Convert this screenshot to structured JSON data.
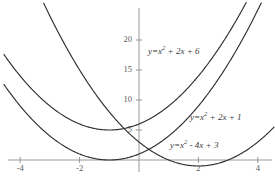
{
  "chart_data": {
    "type": "line",
    "title": "",
    "xlabel": "",
    "ylabel": "",
    "xlim": [
      -4.0,
      4.3
    ],
    "ylim": [
      -1.5,
      23.5
    ],
    "grid": false,
    "legend_position": "inline-annotations",
    "x_ticks": [
      -4,
      -2,
      2,
      4
    ],
    "x_tick_labels": [
      "-4",
      "-2",
      "2",
      "4"
    ],
    "y_ticks": [
      5,
      10,
      15,
      20
    ],
    "y_tick_labels": [
      "5",
      "10",
      "15",
      "20"
    ],
    "axis_color": "#8a8a8a",
    "curve_color": "#2f2f2f",
    "series": [
      {
        "name": "y=x^2 + 2x + 6",
        "equation": "y=x² + 2x + 6",
        "coefficients": {
          "a": 1,
          "b": 2,
          "c": 6
        },
        "vertex": [
          -1,
          5
        ],
        "x": [
          -4,
          -3.5,
          -3,
          -2.5,
          -2,
          -1.5,
          -1,
          -0.5,
          0,
          0.5,
          1,
          1.5,
          2,
          2.5,
          3,
          3.2
        ],
        "values": [
          14,
          11.25,
          9,
          7.25,
          6,
          5.25,
          5,
          5.25,
          6,
          7.25,
          9,
          11.25,
          14,
          17.25,
          21,
          22.64
        ]
      },
      {
        "name": "y=x^2 + 2x + 1",
        "equation": "y=x² + 2x + 1",
        "coefficients": {
          "a": 1,
          "b": 2,
          "c": 1
        },
        "vertex": [
          -1,
          0
        ],
        "x": [
          -4,
          -3.5,
          -3,
          -2.5,
          -2,
          -1.5,
          -1,
          -0.5,
          0,
          0.5,
          1,
          1.5,
          2,
          2.5,
          3,
          3.5,
          3.75
        ],
        "values": [
          9,
          6.25,
          4,
          2.25,
          1,
          0.25,
          0,
          0.25,
          1,
          2.25,
          4,
          6.25,
          9,
          12.25,
          16,
          20.25,
          22.56
        ]
      },
      {
        "name": "y=x^2 - 4x + 3",
        "equation": "y=x² - 4x + 3",
        "coefficients": {
          "a": 1,
          "b": -4,
          "c": 3
        },
        "vertex": [
          2,
          -1
        ],
        "x": [
          -1.5,
          -1,
          -0.5,
          0,
          0.5,
          1,
          1.5,
          2,
          2.5,
          3,
          3.5,
          4,
          4.25
        ],
        "values": [
          11.25,
          8,
          5.25,
          3,
          1.25,
          0,
          -0.75,
          -1,
          -0.75,
          0,
          1.25,
          3,
          4.06
        ]
      }
    ],
    "annotations": [
      {
        "id": "label-1",
        "text_prefix": "y=x",
        "exponent": "2",
        "text_suffix": "+ 2x + 6",
        "x_px": 148,
        "y_px": 44
      },
      {
        "id": "label-2",
        "text_prefix": "y=x",
        "exponent": "2",
        "text_suffix": "+ 2x + 1",
        "x_px": 190,
        "y_px": 110
      },
      {
        "id": "label-3",
        "text_prefix": "y=x",
        "exponent": "2",
        "text_suffix": "- 4x + 3",
        "x_px": 170,
        "y_px": 138
      }
    ]
  }
}
